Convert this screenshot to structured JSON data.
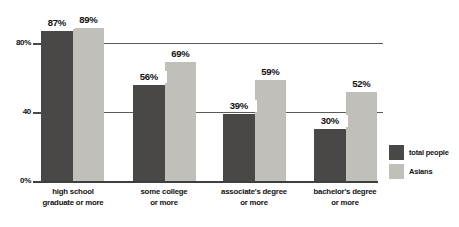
{
  "chart_data": {
    "type": "bar",
    "categories": [
      "high school\ngraduate or more",
      "some college\nor more",
      "associate's degree\nor more",
      "bachelor's degree\nor more"
    ],
    "series": [
      {
        "name": "total people",
        "values": [
          87,
          56,
          39,
          30
        ],
        "color": "#4a4846"
      },
      {
        "name": "Asians",
        "values": [
          89,
          69,
          59,
          52
        ],
        "color": "#c0bfba"
      }
    ],
    "value_labels": [
      [
        "87%",
        "56%",
        "39%",
        "30%"
      ],
      [
        "89%",
        "69%",
        "59%",
        "52%"
      ]
    ],
    "yticks": [
      {
        "value": 80,
        "label": "80%"
      },
      {
        "value": 40,
        "label": "40"
      },
      {
        "value": 0,
        "label": "0%"
      }
    ],
    "ylim": [
      0,
      100
    ],
    "grid_values": [
      80,
      40
    ],
    "title": "",
    "xlabel": "",
    "ylabel": "",
    "legend_position": "right",
    "grid": "horizontal"
  },
  "colors": {
    "background": "#ffffff",
    "grid": "#5a5a5a",
    "axis": "#3f3f3f",
    "text": "#111111"
  }
}
